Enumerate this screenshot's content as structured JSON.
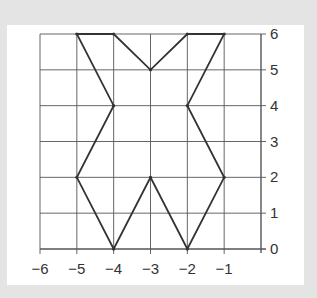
{
  "diagram": {
    "type": "coordinate-grid-shape",
    "x_range": [
      -6,
      0
    ],
    "y_range": [
      0,
      6
    ],
    "x_tick_labels": [
      "−6",
      "−5",
      "−4",
      "−3",
      "−2",
      "−1"
    ],
    "y_tick_labels": [
      "0",
      "1",
      "2",
      "3",
      "4",
      "5",
      "6"
    ],
    "shape_vertices": [
      [
        -5,
        6
      ],
      [
        -4,
        6
      ],
      [
        -3,
        5
      ],
      [
        -2,
        6
      ],
      [
        -1,
        6
      ],
      [
        -2,
        4
      ],
      [
        -1,
        2
      ],
      [
        -2,
        0
      ],
      [
        -3,
        2
      ],
      [
        -4,
        0
      ],
      [
        -5,
        2
      ],
      [
        -4,
        4
      ]
    ],
    "colors": {
      "background": "#e4e4e4",
      "panel": "#ffffff",
      "grid": "#555555",
      "shape": "#333333"
    }
  }
}
